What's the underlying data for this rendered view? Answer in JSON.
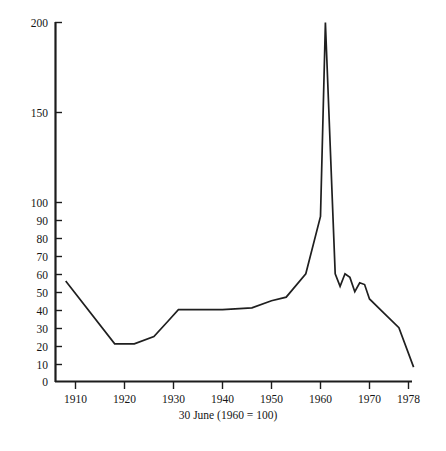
{
  "chart_data": {
    "type": "line",
    "title": "",
    "subtitle": "",
    "xlabel": "30 June (1960 = 100)",
    "ylabel": "",
    "xlim": [
      1906,
      1981
    ],
    "ylim": [
      0,
      200
    ],
    "grid": false,
    "legend": null,
    "legend_position": "none",
    "y_ticks": [
      0,
      10,
      20,
      30,
      40,
      50,
      60,
      70,
      80,
      90,
      100,
      150,
      200
    ],
    "y_tick_labels": [
      "0",
      "10",
      "20",
      "30",
      "40",
      "50",
      "60",
      "70",
      "80",
      "90",
      "100",
      "150",
      "200"
    ],
    "x_ticks": [
      1910,
      1920,
      1930,
      1940,
      1950,
      1960,
      1970,
      1978
    ],
    "x_tick_labels": [
      "1910",
      "1920",
      "1930",
      "1940",
      "1950",
      "1960",
      "1970",
      "1978"
    ],
    "series": [
      {
        "name": "index",
        "color": "#1f1f1f",
        "x": [
          1908,
          1918,
          1922,
          1926,
          1929,
          1931,
          1934,
          1940,
          1946,
          1950,
          1953,
          1957,
          1960,
          1961,
          1963,
          1964,
          1965,
          1966,
          1967,
          1968,
          1969,
          1970,
          1973,
          1976,
          1979
        ],
        "values": [
          56,
          21,
          21,
          25,
          34,
          40,
          40,
          40,
          41,
          45,
          47,
          60,
          92,
          200,
          60,
          53,
          60,
          58,
          50,
          55,
          54,
          46,
          38,
          30,
          8
        ]
      }
    ],
    "annotations": [
      {
        "text": "peak",
        "x": 1961,
        "y": 200
      }
    ]
  },
  "caption": {
    "axis_note": "30 June (1960 = 100)",
    "figure_note": ""
  }
}
